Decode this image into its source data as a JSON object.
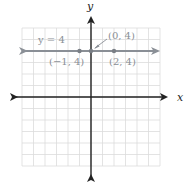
{
  "figure": {
    "marker": "•",
    "x_axis_label": "x",
    "y_axis_label": "y",
    "line_label": "y = 4",
    "points": [
      {
        "label": "(−1, 4)",
        "x": -1,
        "y": 4
      },
      {
        "label": "(0, 4)",
        "x": 0,
        "y": 4
      },
      {
        "label": "(2, 4)",
        "x": 2,
        "y": 4
      }
    ],
    "colors": {
      "grid": "#dcdcdc",
      "axes": "#222222",
      "line": "#8a8f96",
      "labels": "#8a8f96"
    }
  },
  "chart_data": {
    "type": "line",
    "title": "",
    "xlabel": "x",
    "ylabel": "y",
    "xlim": [
      -6,
      6
    ],
    "ylim": [
      -6,
      6
    ],
    "grid": true,
    "series": [
      {
        "name": "y = 4",
        "x": [
          -6,
          6
        ],
        "y": [
          4,
          4
        ]
      }
    ],
    "points": [
      {
        "label": "(−1, 4)",
        "x": -1,
        "y": 4
      },
      {
        "label": "(0, 4)",
        "x": 0,
        "y": 4
      },
      {
        "label": "(2, 4)",
        "x": 2,
        "y": 4
      }
    ]
  }
}
